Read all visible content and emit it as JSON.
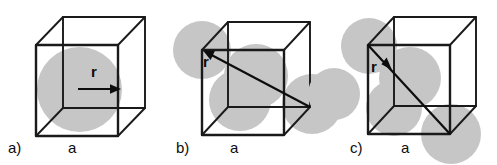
{
  "figure": {
    "type": "diagram",
    "background_color": "#ffffff",
    "sphere_color": "#c6c6c6",
    "line_color": "#1a1a1a",
    "width": 497,
    "height": 165
  },
  "panels": [
    {
      "id": "a",
      "label": "a)",
      "edge_label": "a",
      "radius_label": "r",
      "packing": "simple-cubic",
      "radius_arrow": "horizontal-right",
      "spheres_visible": 1
    },
    {
      "id": "b",
      "label": "b)",
      "edge_label": "a",
      "radius_label": "r",
      "packing": "body-centered-cubic",
      "radius_arrow": "body-diagonal-up-left",
      "spheres_visible": 4
    },
    {
      "id": "c",
      "label": "c)",
      "edge_label": "a",
      "radius_label": "r",
      "packing": "face-centered-cubic",
      "radius_arrow": "face-diagonal-down-right",
      "spheres_visible": 5
    }
  ]
}
